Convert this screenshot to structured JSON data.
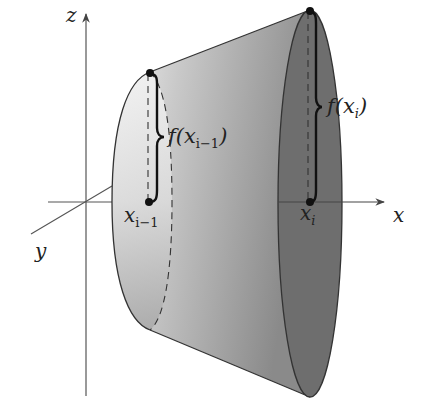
{
  "diagram": {
    "axes": {
      "x_label": "x",
      "y_label": "y",
      "z_label": "z"
    },
    "points": {
      "left": {
        "base_label_main": "x",
        "base_label_sub": "i−1"
      },
      "right": {
        "base_label_main": "x",
        "base_label_sub": "i"
      }
    },
    "heights": {
      "left": {
        "prefix": "f(",
        "main": "x",
        "sub": "i−1",
        "suffix": ")"
      },
      "right": {
        "prefix": "f(",
        "main": "x",
        "sub": "i",
        "suffix": ")"
      }
    },
    "colors": {
      "left_face_light": "#e6e6e6",
      "surface_mid": "#a9a9a9",
      "right_face": "#6e6e6e",
      "outline": "#333333",
      "axis": "#555555"
    }
  }
}
